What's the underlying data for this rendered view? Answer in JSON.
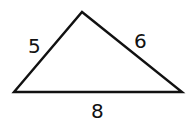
{
  "diagram": {
    "type": "triangle",
    "vertices": {
      "left": [
        14,
        92
      ],
      "top": [
        82,
        12
      ],
      "right": [
        182,
        92
      ]
    },
    "sides": [
      {
        "id": "left-side",
        "label": "5"
      },
      {
        "id": "right-side",
        "label": "6"
      },
      {
        "id": "base",
        "label": "8"
      }
    ],
    "stroke_color": "#111111"
  }
}
